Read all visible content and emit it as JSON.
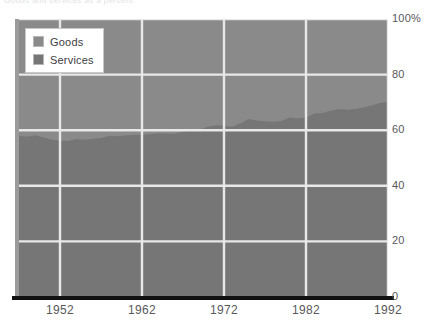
{
  "top_text": "Goods and services as a percent",
  "chart_data": {
    "type": "area",
    "stacked": true,
    "title": "",
    "subtitle": "",
    "xlabel": "",
    "ylabel": "",
    "xlim": [
      1947,
      1992
    ],
    "ylim": [
      0,
      100
    ],
    "grid": true,
    "legend_position": "top-left",
    "x_tick_labels": [
      "1952",
      "1962",
      "1972",
      "1982",
      "1992"
    ],
    "x_tick_values": [
      1952,
      1962,
      1972,
      1982,
      1992
    ],
    "y_tick_labels": [
      "100%",
      "80",
      "60",
      "40",
      "20",
      "0"
    ],
    "y_tick_values": [
      100,
      80,
      60,
      40,
      20,
      0
    ],
    "x": [
      1947,
      1948,
      1949,
      1950,
      1951,
      1952,
      1953,
      1954,
      1955,
      1956,
      1957,
      1958,
      1959,
      1960,
      1961,
      1962,
      1963,
      1964,
      1965,
      1966,
      1967,
      1968,
      1969,
      1970,
      1971,
      1972,
      1973,
      1974,
      1975,
      1976,
      1977,
      1978,
      1979,
      1980,
      1981,
      1982,
      1983,
      1984,
      1985,
      1986,
      1987,
      1988,
      1989,
      1990,
      1991,
      1992
    ],
    "series": [
      {
        "name": "Services",
        "color": "#767676",
        "values": [
          58.0,
          57.6,
          58.2,
          57.4,
          56.6,
          56.3,
          56.1,
          56.8,
          56.6,
          56.9,
          57.2,
          58.0,
          57.8,
          58.1,
          58.4,
          58.3,
          58.6,
          58.9,
          58.8,
          58.7,
          59.4,
          60.0,
          60.2,
          61.2,
          61.8,
          61.6,
          61.2,
          62.4,
          64.0,
          63.5,
          63.2,
          63.0,
          63.3,
          64.6,
          64.2,
          64.6,
          66.0,
          66.2,
          67.0,
          67.6,
          67.4,
          67.6,
          68.2,
          68.9,
          69.8,
          70.2
        ]
      },
      {
        "name": "Goods",
        "color": "#8a8a8a",
        "values": [
          42.0,
          42.4,
          41.8,
          42.6,
          43.4,
          43.7,
          43.9,
          43.2,
          43.4,
          43.1,
          42.8,
          42.0,
          42.2,
          41.9,
          41.6,
          41.7,
          41.4,
          41.1,
          41.2,
          41.3,
          40.6,
          40.0,
          39.8,
          38.8,
          38.2,
          38.4,
          38.8,
          37.6,
          36.0,
          36.5,
          36.8,
          37.0,
          36.7,
          35.4,
          35.8,
          35.4,
          34.0,
          33.8,
          33.0,
          32.4,
          32.6,
          32.4,
          31.8,
          31.1,
          30.2,
          29.8
        ]
      }
    ],
    "legend": [
      {
        "label": "Goods",
        "color": "#8a8a8a"
      },
      {
        "label": "Services",
        "color": "#767676"
      }
    ],
    "colors": {
      "goods": "#8a8a8a",
      "services": "#767676",
      "gridline": "#e8e8e8",
      "axis": "#111111",
      "tick_text": "#58585a"
    }
  }
}
